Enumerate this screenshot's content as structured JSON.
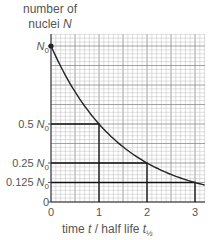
{
  "chart_data": {
    "type": "line",
    "title": "",
    "ylabel": "number of nuclei N",
    "xlabel": "time t / half life t½",
    "x_ticks": [
      "0",
      "1",
      "2",
      "3"
    ],
    "y_ticks": [
      "0",
      "0.125 N0",
      "0.25 N0",
      "0.5 N0",
      "N0"
    ],
    "xlim": [
      0,
      3.2
    ],
    "ylim": [
      0,
      1.1
    ],
    "grid": true,
    "series": [
      {
        "name": "N = N0 (1/2)^(t/t½)",
        "x": [
          0,
          0.5,
          1,
          1.5,
          2,
          2.5,
          3,
          3.2
        ],
        "values": [
          1,
          0.707,
          0.5,
          0.354,
          0.25,
          0.177,
          0.125,
          0.109
        ]
      }
    ],
    "annotations": [
      {
        "type": "guide",
        "x": 1,
        "y": 0.5
      },
      {
        "type": "guide",
        "x": 2,
        "y": 0.25
      },
      {
        "type": "guide",
        "x": 3,
        "y": 0.125
      },
      {
        "type": "point",
        "x": 0,
        "y": 1,
        "label": "N0"
      }
    ]
  },
  "labels": {
    "ylabel_line1": "number of",
    "ylabel_line2": "nuclei ",
    "ylabel_var": "N",
    "yt_n0_var": "N",
    "yt_n0_sub": "0",
    "yt_half_num": "0.5 ",
    "yt_quarter_num": "0.25 ",
    "yt_eighth_num": "0.125 ",
    "yt_zero": "0",
    "xt0": "0",
    "xt1": "1",
    "xt2": "2",
    "xt3": "3",
    "xlabel_pre": "time ",
    "xlabel_t": "t",
    "xlabel_mid": " / half life ",
    "xlabel_t2": "t",
    "xlabel_sub": "½"
  }
}
